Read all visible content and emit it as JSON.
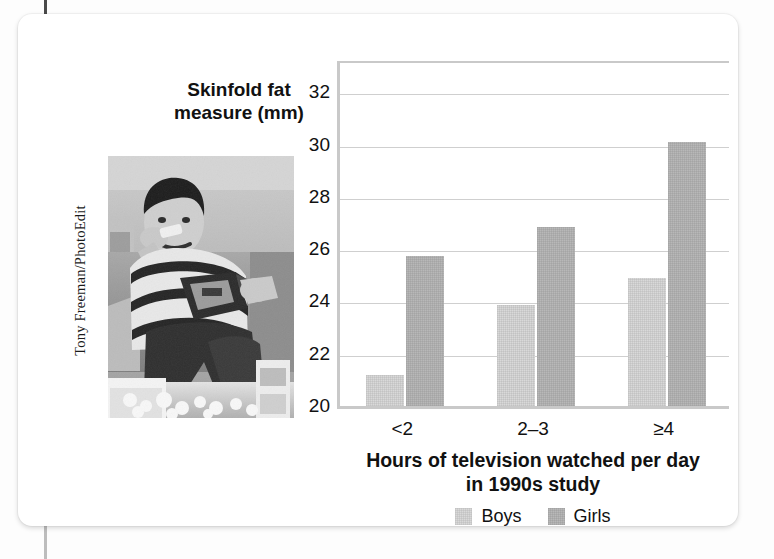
{
  "photo": {
    "credit": "Tony Freeman/PhotoEdit",
    "alt_description": "Boy eating snack food while sitting on a couch surrounded by junk food"
  },
  "chart_data": {
    "type": "bar",
    "title": "",
    "categories": [
      "<2",
      "2–3",
      "≥4"
    ],
    "series": [
      {
        "name": "Boys",
        "values": [
          21.2,
          23.85,
          24.9
        ],
        "color": "#d9d9d9"
      },
      {
        "name": "Girls",
        "values": [
          25.75,
          26.85,
          30.1
        ],
        "color": "#b8b8b8"
      }
    ],
    "xlabel": "Hours of television watched per day in 1990s study",
    "xlabel_line1": "Hours of television watched per day",
    "xlabel_line2": "in 1990s study",
    "ylabel": "Skinfold fat measure (mm)",
    "ylabel_line1": "Skinfold fat",
    "ylabel_line2": "measure (mm)",
    "ylim": [
      20,
      33.2
    ],
    "yticks": [
      32,
      30,
      28,
      26,
      24,
      22,
      20
    ],
    "grid": true,
    "legend_position": "bottom"
  }
}
